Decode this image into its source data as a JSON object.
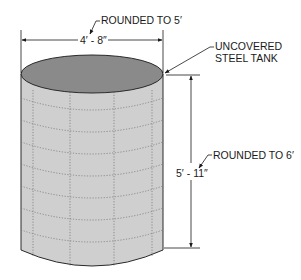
{
  "diagram": {
    "subject": "Uncovered steel tank",
    "labels": {
      "width_dimension": "4′ - 8″",
      "width_rounded": "ROUNDED TO 5′",
      "tank_label_line1": "UNCOVERED",
      "tank_label_line2": "STEEL TANK",
      "height_dimension": "5′ - 11″",
      "height_rounded": "ROUNDED TO 6′"
    },
    "colors": {
      "top_fill": "#8a8a8a",
      "body_fill": "#cfcfcf",
      "outline": "#2a2a2a",
      "seam": "#7a7a7a"
    }
  }
}
